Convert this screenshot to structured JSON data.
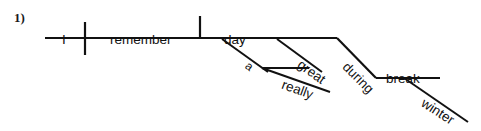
{
  "page": {
    "width": 481,
    "height": 131,
    "background": "#ffffff",
    "ink": "#111111"
  },
  "exercise": {
    "number_label": "1)"
  },
  "diagram": {
    "type": "reed-kellogg-sentence-diagram",
    "sentence": "I remember a really great day during winter break.",
    "words": [
      {
        "id": "subject",
        "text": "I",
        "role": "subject",
        "x": 62,
        "y": 33,
        "rotation": 0,
        "size": "normal"
      },
      {
        "id": "verb",
        "text": "remember",
        "role": "verb",
        "x": 110,
        "y": 33,
        "rotation": 0,
        "size": "normal"
      },
      {
        "id": "direct-object",
        "text": "day",
        "role": "direct-object",
        "x": 224,
        "y": 33,
        "rotation": 0,
        "size": "normal"
      },
      {
        "id": "article-a",
        "text": "a",
        "role": "article-modifier",
        "x": 243,
        "y": 57,
        "rotation": 36,
        "size": "small"
      },
      {
        "id": "adjective-great",
        "text": "great",
        "role": "adjective-modifier",
        "x": 295,
        "y": 55,
        "rotation": 36,
        "size": "normal"
      },
      {
        "id": "adverb-really",
        "text": "really",
        "role": "adverb-modifier",
        "x": 280,
        "y": 77,
        "rotation": 20,
        "size": "normal"
      },
      {
        "id": "preposition-during",
        "text": "during",
        "role": "preposition",
        "x": 340,
        "y": 56,
        "rotation": 45,
        "size": "normal"
      },
      {
        "id": "object-of-preposition",
        "text": "break",
        "role": "object-of-preposition",
        "x": 386,
        "y": 72,
        "rotation": 0,
        "size": "normal"
      },
      {
        "id": "noun-modifier-winter",
        "text": "winter",
        "role": "noun-modifier",
        "x": 419,
        "y": 94,
        "rotation": 33,
        "size": "normal"
      }
    ],
    "lines": [
      {
        "id": "main-baseline",
        "kind": "baseline",
        "x1": 45,
        "y1": 38,
        "x2": 222,
        "y2": 38,
        "width": 2.2
      },
      {
        "id": "subject-verb-divider",
        "kind": "divider-crossing",
        "x1": 85,
        "y1": 22,
        "x2": 85,
        "y2": 55,
        "width": 2.2
      },
      {
        "id": "verb-object-divider",
        "kind": "divider-above",
        "x1": 200,
        "y1": 16,
        "x2": 200,
        "y2": 38,
        "width": 2.2
      },
      {
        "id": "object-baseline",
        "kind": "baseline",
        "x1": 222,
        "y1": 38,
        "x2": 337,
        "y2": 38,
        "width": 2.2
      },
      {
        "id": "article-a-line",
        "kind": "modifier-slant",
        "x1": 222,
        "y1": 39,
        "x2": 268,
        "y2": 72,
        "width": 2.0
      },
      {
        "id": "adjective-great-line",
        "kind": "modifier-slant",
        "x1": 277,
        "y1": 39,
        "x2": 322,
        "y2": 72,
        "width": 2.0
      },
      {
        "id": "really-support-line",
        "kind": "modifier-horizontal",
        "x1": 262,
        "y1": 68,
        "x2": 309,
        "y2": 68,
        "width": 2.0
      },
      {
        "id": "adverb-really-line",
        "kind": "modifier-slant",
        "x1": 262,
        "y1": 68,
        "x2": 330,
        "y2": 92,
        "width": 2.0
      },
      {
        "id": "preposition-during-line",
        "kind": "preposition-slant",
        "x1": 337,
        "y1": 38,
        "x2": 376,
        "y2": 78,
        "width": 2.2
      },
      {
        "id": "prep-object-baseline",
        "kind": "baseline",
        "x1": 376,
        "y1": 78,
        "x2": 440,
        "y2": 78,
        "width": 2.2
      },
      {
        "id": "noun-modifier-winter-line",
        "kind": "modifier-slant",
        "x1": 404,
        "y1": 78,
        "x2": 468,
        "y2": 122,
        "width": 2.0
      }
    ]
  }
}
